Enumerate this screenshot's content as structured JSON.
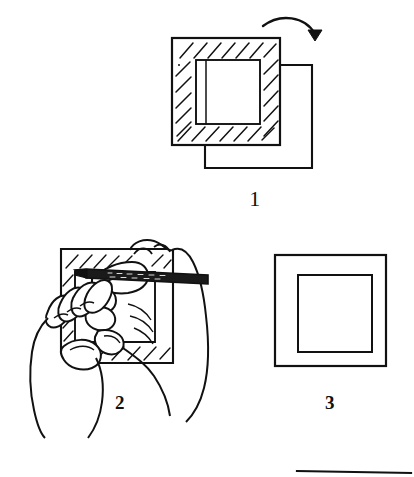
{
  "figure": {
    "medium": "pen and ink line art",
    "background_color": "#ffffff",
    "ink_color": "#111111",
    "canvas": {
      "width": 414,
      "height": 477
    }
  },
  "steps": [
    {
      "number": "1",
      "caption": "1",
      "caption_position": {
        "x": 255,
        "y": 190
      },
      "name": "step-one-mat-over-backing",
      "description": "Hatched mat board with cut window resting on top of a plain backing board that is offset down and to the right; a curved arrow at the upper right indicates folding the backing board over.",
      "elements": [
        "backing-board-rectangle",
        "hatched-mat-board",
        "mat-window-opening",
        "fold-arrow"
      ]
    },
    {
      "number": "2",
      "caption": "2",
      "caption_position": {
        "x": 120,
        "y": 395
      },
      "name": "step-two-hands-drawing",
      "description": "Two hands shown: the left hand steadies a hatched board while the right hand holds a pencil and rules the window outline on it.",
      "elements": [
        "hatched-board",
        "pencil-drawn-window-outline",
        "left-hand-holding-board",
        "right-hand-holding-pencil",
        "pencil"
      ]
    },
    {
      "number": "3",
      "caption": "3",
      "caption_position": {
        "x": 330,
        "y": 395
      },
      "name": "step-three-finished-mat",
      "description": "The finished mat: a plain outer rectangle with a concentric inner rectangle, no hatching.",
      "elements": [
        "outer-frame-rectangle",
        "inner-window-rectangle"
      ]
    },
    {
      "number": "4",
      "caption": "",
      "name": "step-four-cropped",
      "description": "The top edge of a fourth figure, cropped off at the bottom right of the page.",
      "elements": [
        "cropped-top-edge-line"
      ]
    }
  ],
  "annotations": {
    "fold_arrow": {
      "name": "fold-arrow",
      "shape": "curved arrow arcing right then hooking down",
      "meaning": "fold or flip the backing board over onto the mat"
    }
  },
  "colors": {
    "ink": "#111111",
    "paper": "#ffffff",
    "pencil_body": "#1a1a1a"
  }
}
